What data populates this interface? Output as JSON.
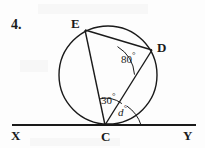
{
  "question": {
    "number": "4."
  },
  "figure": {
    "points": {
      "E": {
        "label": "E",
        "x": 85,
        "y": 30
      },
      "D": {
        "label": "D",
        "x": 152,
        "y": 50
      },
      "C": {
        "label": "C",
        "x": 105,
        "y": 125
      },
      "X": {
        "label": "X",
        "x": 14,
        "y": 125
      },
      "Y": {
        "label": "Y",
        "x": 193,
        "y": 125
      }
    },
    "angles": [
      {
        "name": "angle-at-D",
        "value": "80",
        "degree_symbol": "°",
        "vertex": "D"
      },
      {
        "name": "angle-ECD",
        "value": "30",
        "degree_symbol": "°",
        "vertex": "C"
      },
      {
        "name": "angle-DCY",
        "value": "d",
        "degree_symbol": "°",
        "vertex": "C"
      }
    ],
    "circle": {
      "cx": 108,
      "cy": 75,
      "r": 49
    },
    "tangent_line": {
      "name": "XY",
      "y": 125,
      "x1": 12,
      "x2": 196
    },
    "stroke_color": "#1a1a1a"
  }
}
